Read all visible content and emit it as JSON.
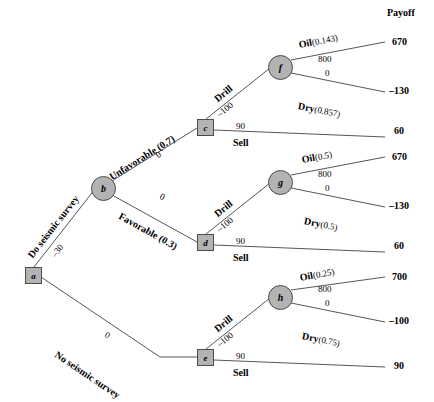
{
  "figure": {
    "title_right": "Payoff",
    "type": "decision-tree"
  },
  "nodes": [
    {
      "id": "a",
      "label": "a",
      "shape": "square",
      "x": 25,
      "y": 267
    },
    {
      "id": "b",
      "label": "b",
      "shape": "circle",
      "x": 91,
      "y": 176
    },
    {
      "id": "c",
      "label": "c",
      "shape": "square",
      "x": 197,
      "y": 119
    },
    {
      "id": "d",
      "label": "d",
      "shape": "square",
      "x": 197,
      "y": 234
    },
    {
      "id": "e",
      "label": "e",
      "shape": "square",
      "x": 197,
      "y": 349
    },
    {
      "id": "f",
      "label": "f",
      "shape": "circle",
      "x": 268,
      "y": 55
    },
    {
      "id": "g",
      "label": "g",
      "shape": "circle",
      "x": 268,
      "y": 170
    },
    {
      "id": "h",
      "label": "h",
      "shape": "circle",
      "x": 268,
      "y": 285
    }
  ],
  "branches": {
    "do_seismic": {
      "name": "Do seismic survey",
      "value": "–30"
    },
    "no_seismic": {
      "name": "No seismic survey",
      "value": "0"
    },
    "unfavorable": {
      "name": "Unfavorable (0.7)",
      "value": "0"
    },
    "favorable": {
      "name": "Favorable (0.3)",
      "value": "0"
    },
    "drill": {
      "name": "Drill",
      "value": "–100"
    },
    "sell": {
      "name": "Sell",
      "value": "90"
    }
  },
  "chance_nodes": {
    "f": {
      "oil_label": "Oil",
      "oil_prob": "(0.143)",
      "dry_label": "Dry",
      "dry_prob": "(0.857)",
      "oil_value": "800",
      "dry_value": "0"
    },
    "g": {
      "oil_label": "Oil",
      "oil_prob": "(0.5)",
      "dry_label": "Dry",
      "dry_prob": "(0.5)",
      "oil_value": "800",
      "dry_value": "0"
    },
    "h": {
      "oil_label": "Oil",
      "oil_prob": "(0.25)",
      "dry_label": "Dry",
      "dry_prob": "(0.75)",
      "oil_value": "800",
      "dry_value": "0"
    }
  },
  "payoffs": [
    {
      "key": "f_oil",
      "value": "670"
    },
    {
      "key": "f_dry",
      "value": "–130"
    },
    {
      "key": "c_sell",
      "value": "60"
    },
    {
      "key": "g_oil",
      "value": "670"
    },
    {
      "key": "g_dry",
      "value": "–130"
    },
    {
      "key": "d_sell",
      "value": "60"
    },
    {
      "key": "h_oil",
      "value": "700"
    },
    {
      "key": "h_dry",
      "value": "–100"
    },
    {
      "key": "e_sell",
      "value": "90"
    }
  ],
  "colors": {
    "node_fill": "#b3b3b3",
    "node_stroke": "#4d4d4d",
    "line": "#55565a",
    "text": "#000000",
    "background": "#ffffff"
  }
}
